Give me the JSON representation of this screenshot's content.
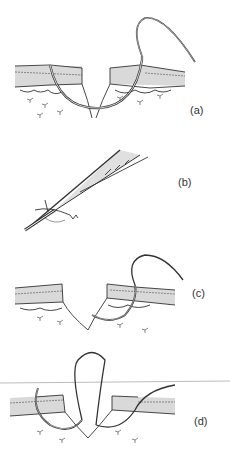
{
  "figure": {
    "panels": [
      {
        "id": "a",
        "label": "(a)",
        "description": "Curved needle passed through both wound edges"
      },
      {
        "id": "b",
        "label": "(b)",
        "description": "Needle held in needle holder with suture"
      },
      {
        "id": "c",
        "label": "(c)",
        "description": "Needle passing through one wound edge"
      },
      {
        "id": "d",
        "label": "(d)",
        "description": "Suture loop formed across wound"
      }
    ],
    "colors": {
      "line": "#333333",
      "skin_fill": "#d9d9d9",
      "background": "#ffffff"
    }
  }
}
